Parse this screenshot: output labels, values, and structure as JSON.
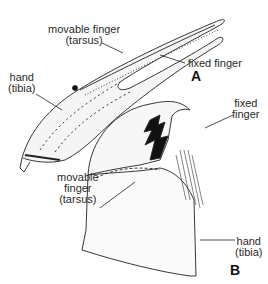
{
  "figure": {
    "panel_a": {
      "letter": "A",
      "labels": {
        "movable_finger": "movable finger",
        "movable_finger_sub": "(tarsus)",
        "fixed_finger": "fixed finger",
        "hand": "hand",
        "hand_sub": "(tibia)"
      }
    },
    "panel_b": {
      "letter": "B",
      "labels": {
        "fixed_finger_1": "fixed",
        "fixed_finger_2": "finger",
        "movable_1": "movable",
        "movable_2": "finger",
        "movable_3": "(tarsus)",
        "hand": "hand",
        "hand_sub": "(tibia)"
      }
    },
    "colors": {
      "line": "#222222",
      "fill": "#f4f4f4"
    }
  }
}
